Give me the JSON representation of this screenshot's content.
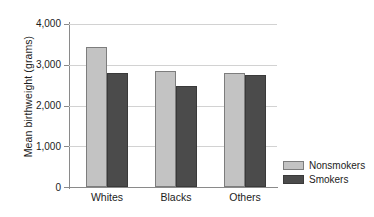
{
  "chart_data": {
    "type": "bar",
    "title": "",
    "subtitle": "",
    "xlabel": "",
    "ylabel": "Mean birthweight (grams)",
    "categories": [
      "Whites",
      "Blacks",
      "Others"
    ],
    "series": [
      {
        "name": "Nonsmokers",
        "color": "#c3c3c3",
        "values": [
          3440,
          2850,
          2810
        ]
      },
      {
        "name": "Smokers",
        "color": "#4b4b4b",
        "values": [
          2810,
          2490,
          2740
        ]
      }
    ],
    "ylim": [
      0,
      4000
    ],
    "yticks": [
      0,
      1000,
      2000,
      3000,
      4000
    ],
    "ytick_labels": [
      "0",
      "1,000",
      "2,000",
      "3,000",
      "4,000"
    ],
    "grid": "horizontal",
    "legend_position": "right-bottom",
    "background": "#ffffff"
  },
  "legend": {
    "entries": [
      {
        "label": "Nonsmokers"
      },
      {
        "label": "Smokers"
      }
    ]
  },
  "axes": {
    "y_title": "Mean birthweight (grams)",
    "tick_4000": "4,000",
    "tick_3000": "3,000",
    "tick_2000": "2,000",
    "tick_1000": "1,000",
    "tick_0": "0"
  },
  "categories": {
    "c0": "Whites",
    "c1": "Blacks",
    "c2": "Others"
  }
}
